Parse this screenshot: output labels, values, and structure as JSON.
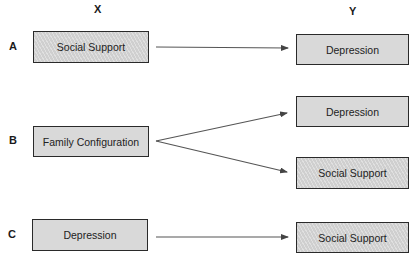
{
  "columns": {
    "x": "X",
    "y": "Y"
  },
  "rows": [
    {
      "label": "A",
      "left": {
        "text": "Social Support",
        "fill": "hatched"
      },
      "right": [
        {
          "text": "Depression",
          "fill": "plain"
        }
      ]
    },
    {
      "label": "B",
      "left": {
        "text": "Family Configuration",
        "fill": "plain"
      },
      "right": [
        {
          "text": "Depression",
          "fill": "plain"
        },
        {
          "text": "Social Support",
          "fill": "hatched"
        }
      ]
    },
    {
      "label": "C",
      "left": {
        "text": "Depression",
        "fill": "plain"
      },
      "right": [
        {
          "text": "Social Support",
          "fill": "hatched"
        }
      ]
    }
  ],
  "colors": {
    "box_fill": "#d9d9d9",
    "hatched_fill": "#cfcfcf",
    "border": "#2a2a2a",
    "arrow": "#444444"
  }
}
